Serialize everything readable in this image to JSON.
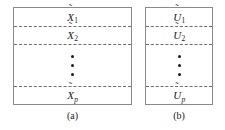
{
  "figure": {
    "type": "diagram",
    "colors": {
      "background": "#ffffff",
      "border": "#8a8a8a",
      "divider": "#6e6e6e",
      "text": "#1b1b1b"
    },
    "panels": [
      {
        "caption": "(a)",
        "name": "panel-a",
        "regions": [
          {
            "base": "X",
            "accent": "˜",
            "subscript": "1",
            "subscript_italic": false
          },
          {
            "base": "X",
            "accent": "˜",
            "subscript": "2",
            "subscript_italic": false
          },
          {
            "base": "",
            "accent": "",
            "subscript": "",
            "subscript_italic": false
          },
          {
            "base": "X",
            "accent": "˜",
            "subscript": "p",
            "subscript_italic": true
          }
        ],
        "ellipsis_dots": 3,
        "divider_count": 3
      },
      {
        "caption": "(b)",
        "name": "panel-b",
        "regions": [
          {
            "base": "U",
            "accent": "˜",
            "subscript": "1",
            "subscript_italic": false
          },
          {
            "base": "U",
            "accent": "˜",
            "subscript": "2",
            "subscript_italic": false
          },
          {
            "base": "",
            "accent": "",
            "subscript": "",
            "subscript_italic": false
          },
          {
            "base": "U",
            "accent": "˜",
            "subscript": "p",
            "subscript_italic": true
          }
        ],
        "ellipsis_dots": 3,
        "divider_count": 3
      }
    ]
  }
}
